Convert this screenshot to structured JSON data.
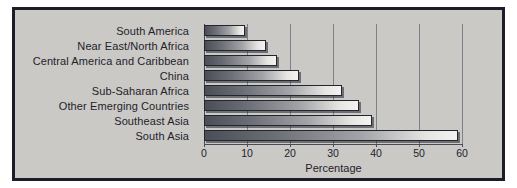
{
  "chart_data": {
    "type": "bar",
    "orientation": "horizontal",
    "title": "",
    "xlabel": "Percentage",
    "ylabel": "",
    "xlim": [
      0,
      60
    ],
    "xticks": [
      0,
      10,
      20,
      30,
      40,
      50,
      60
    ],
    "grid": true,
    "legend": false,
    "categories": [
      "South America",
      "Near East/North Africa",
      "Central America and Caribbean",
      "China",
      "Sub-Saharan Africa",
      "Other Emerging Countries",
      "Southeast Asia",
      "South Asia"
    ],
    "values": [
      9.5,
      14.5,
      17,
      22,
      32,
      36,
      39,
      59
    ]
  },
  "style": {
    "background": "#cac9c5",
    "frame_color": "#1b1d28",
    "outer_background": "#ffffff",
    "text_color": "#1f222c",
    "gridline_color": "#7e8089",
    "bar_outline": "#24262f",
    "bar_gradient_start": "#4c4e57",
    "bar_gradient_end": "#f4f3f1"
  }
}
